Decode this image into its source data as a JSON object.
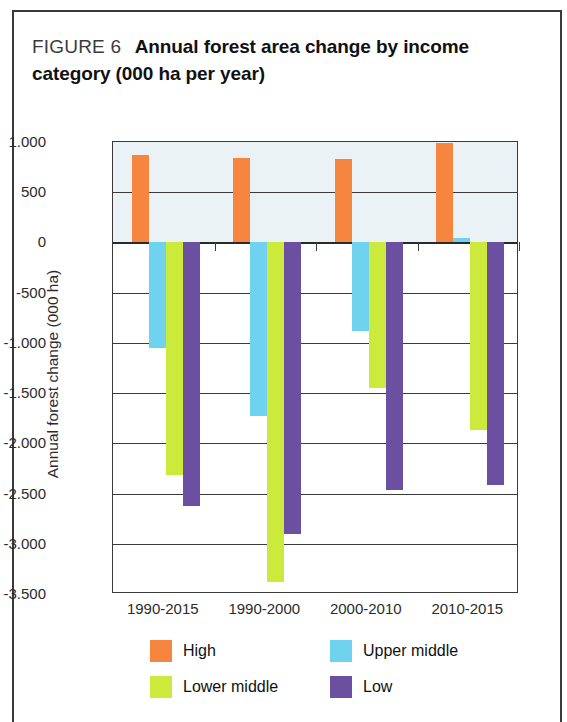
{
  "figure": {
    "label": "FIGURE 6",
    "title": "Annual forest area change by income category (000 ha per year)"
  },
  "colors": {
    "high": "#F5853F",
    "upper_middle": "#6FD3EF",
    "lower_middle": "#CCEA3C",
    "low": "#6B4FA0",
    "axis": "#3a3a3a",
    "plot_tint": "#ebf2f5"
  },
  "legend": {
    "position": "bottom",
    "items": [
      {
        "label": "High",
        "color_key": "high"
      },
      {
        "label": "Upper middle",
        "color_key": "upper_middle"
      },
      {
        "label": "Lower middle",
        "color_key": "lower_middle"
      },
      {
        "label": "Low",
        "color_key": "low"
      }
    ]
  },
  "chart_data": {
    "type": "bar",
    "title": "Annual forest area change by income category (000 ha per year)",
    "xlabel": "",
    "ylabel": "Annual forest change (000 ha)",
    "categories": [
      "1990-2015",
      "1990-2000",
      "2000-2010",
      "2010-2015"
    ],
    "series": [
      {
        "name": "High",
        "color": "#F5853F",
        "values": [
          870,
          845,
          835,
          995
        ]
      },
      {
        "name": "Upper middle",
        "color": "#6FD3EF",
        "values": [
          -1050,
          -1730,
          -880,
          40
        ]
      },
      {
        "name": "Lower middle",
        "color": "#CCEA3C",
        "values": [
          -2320,
          -3380,
          -1450,
          -1870
        ]
      },
      {
        "name": "Low",
        "color": "#6B4FA0",
        "values": [
          -2620,
          -2900,
          -2460,
          -2410
        ]
      }
    ],
    "ylim": [
      -3500,
      1000
    ],
    "ytick_values": [
      1000,
      500,
      0,
      -500,
      -1000,
      -1500,
      -2000,
      -2500,
      -3000,
      -3500
    ],
    "ytick_labels": [
      "1.000",
      "500",
      "0",
      "-500",
      "-1.000",
      "-1.500",
      "-2.000",
      "-2.500",
      "-3.000",
      "-3.500"
    ],
    "grid": true,
    "legend_position": "bottom"
  }
}
